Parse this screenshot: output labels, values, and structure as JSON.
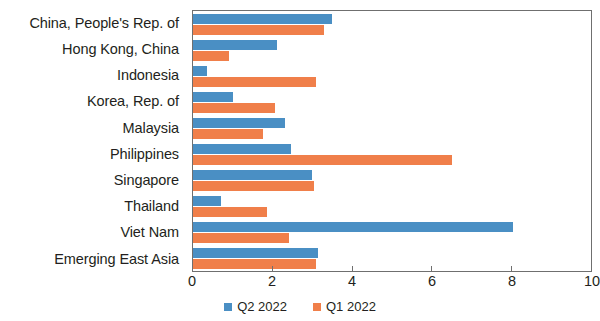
{
  "chart_data": {
    "type": "bar",
    "orientation": "horizontal",
    "title": "",
    "subtitle": "",
    "xlabel": "",
    "ylabel": "",
    "xlim": [
      0,
      10
    ],
    "xticks": [
      0,
      2,
      4,
      6,
      8,
      10
    ],
    "xtick_labels": [
      "0",
      "2",
      "4",
      "6",
      "8",
      "10"
    ],
    "grid": false,
    "legend_position": "bottom-center",
    "categories": [
      "China, People's Rep. of",
      "Hong Kong, China",
      "Indonesia",
      "Korea, Rep. of",
      "Malaysia",
      "Philippines",
      "Singapore",
      "Thailand",
      "Viet Nam",
      "Emerging East Asia"
    ],
    "series": [
      {
        "name": "Q2 2022",
        "color": "#4a8fc4",
        "values": [
          3.5,
          2.1,
          0.35,
          1.0,
          2.3,
          2.45,
          3.0,
          0.7,
          8.05,
          3.15
        ]
      },
      {
        "name": "Q1 2022",
        "color": "#f07f4a",
        "values": [
          3.3,
          0.9,
          3.1,
          2.05,
          1.75,
          6.5,
          3.05,
          1.85,
          2.4,
          3.1
        ]
      }
    ]
  }
}
